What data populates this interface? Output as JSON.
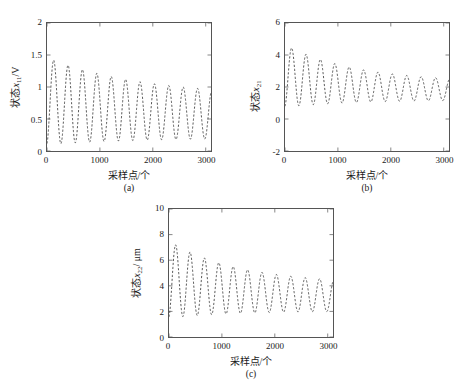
{
  "figure": {
    "background": "#ffffff",
    "line_color": "#3a3a3a",
    "axis_color": "#555555"
  },
  "panels": [
    {
      "caption": "(a)",
      "xlabel": "采样点/个",
      "ylabel_prefix": "状态",
      "ylabel_var": "x",
      "ylabel_sub": "11",
      "ylabel_suffix": "/V",
      "ylabel_full": "状态x11/V",
      "xticks": [
        "0",
        "1000",
        "2000",
        "3000"
      ],
      "yticks": [
        "0",
        "0.5",
        "1",
        "1.5",
        "2"
      ]
    },
    {
      "caption": "(b)",
      "xlabel": "采样点/个",
      "ylabel_prefix": "状态",
      "ylabel_var": "x",
      "ylabel_sub": "21",
      "ylabel_suffix": "",
      "ylabel_full": "状态x21",
      "xticks": [
        "0",
        "1000",
        "2000",
        "3000"
      ],
      "yticks": [
        "-2",
        "0",
        "2",
        "4",
        "6"
      ]
    },
    {
      "caption": "(c)",
      "xlabel": "采样点/个",
      "ylabel_prefix": "状态",
      "ylabel_var": "x",
      "ylabel_sub": "22",
      "ylabel_suffix": "/ μm",
      "ylabel_full": "状态x22/ μm",
      "xticks": [
        "0",
        "1000",
        "2000",
        "3000"
      ],
      "yticks": [
        "0",
        "2",
        "4",
        "6",
        "8",
        "10"
      ]
    }
  ],
  "chart_data": [
    {
      "type": "line",
      "panel": "(a)",
      "title": "",
      "xlabel": "采样点/个",
      "ylabel": "状态x11/V",
      "xlim": [
        0,
        3100
      ],
      "ylim": [
        0,
        2
      ],
      "xticks": [
        0,
        1000,
        2000,
        3000
      ],
      "yticks": [
        0,
        0.5,
        1,
        1.5,
        2
      ],
      "grid": false,
      "legend": "none",
      "linestyle": "dashed",
      "series": [
        {
          "name": "x11",
          "description": "Damped oscillation settling toward ~0.55 mean; initial peak ~1.45 at n~110, troughs ~0.17, period ~270 samples.",
          "model": {
            "mean_start": 0.78,
            "mean_end": 0.53,
            "amp_start": 0.68,
            "amp_end": 0.32,
            "period": 272,
            "phase": -1.35,
            "decay": 0.00055
          },
          "sample_points": [
            {
              "x": 0,
              "y": 0.95
            },
            {
              "x": 110,
              "y": 1.45
            },
            {
              "x": 240,
              "y": 0.2
            },
            {
              "x": 390,
              "y": 1.3
            },
            {
              "x": 520,
              "y": 0.2
            },
            {
              "x": 670,
              "y": 1.21
            },
            {
              "x": 800,
              "y": 0.2
            },
            {
              "x": 940,
              "y": 1.12
            },
            {
              "x": 1070,
              "y": 0.2
            },
            {
              "x": 1210,
              "y": 1.02
            },
            {
              "x": 1340,
              "y": 0.2
            },
            {
              "x": 1480,
              "y": 0.96
            },
            {
              "x": 1610,
              "y": 0.2
            },
            {
              "x": 1750,
              "y": 0.88
            },
            {
              "x": 1880,
              "y": 0.21
            },
            {
              "x": 2020,
              "y": 0.84
            },
            {
              "x": 2150,
              "y": 0.21
            },
            {
              "x": 2290,
              "y": 0.8
            },
            {
              "x": 2420,
              "y": 0.22
            },
            {
              "x": 2560,
              "y": 0.79
            },
            {
              "x": 2690,
              "y": 0.22
            },
            {
              "x": 2830,
              "y": 0.78
            },
            {
              "x": 2960,
              "y": 0.23
            },
            {
              "x": 3060,
              "y": 0.45
            }
          ]
        }
      ]
    },
    {
      "type": "line",
      "panel": "(b)",
      "title": "",
      "xlabel": "采样点/个",
      "ylabel": "状态x21",
      "xlim": [
        0,
        3100
      ],
      "ylim": [
        -2,
        6
      ],
      "xticks": [
        0,
        1000,
        2000,
        3000
      ],
      "yticks": [
        -2,
        0,
        2,
        4,
        6
      ],
      "grid": false,
      "legend": "none",
      "linestyle": "dashed",
      "series": [
        {
          "name": "x21",
          "description": "Damped oscillation around mean ~1.8; initial peak ~4.6 at n~90, troughs ~1.2, period ~272 samples.",
          "model": {
            "mean_start": 2.7,
            "mean_end": 1.75,
            "amp_start": 1.95,
            "amp_end": 0.55,
            "period": 272,
            "phase": -1.35,
            "decay": 0.00075
          },
          "sample_points": [
            {
              "x": 0,
              "y": 3.4
            },
            {
              "x": 90,
              "y": 4.6
            },
            {
              "x": 240,
              "y": 1.3
            },
            {
              "x": 380,
              "y": 4.25
            },
            {
              "x": 520,
              "y": 1.25
            },
            {
              "x": 660,
              "y": 3.95
            },
            {
              "x": 800,
              "y": 1.25
            },
            {
              "x": 930,
              "y": 3.6
            },
            {
              "x": 1070,
              "y": 1.3
            },
            {
              "x": 1200,
              "y": 3.2
            },
            {
              "x": 1340,
              "y": 1.3
            },
            {
              "x": 1480,
              "y": 3.1
            },
            {
              "x": 1610,
              "y": 1.3
            },
            {
              "x": 1750,
              "y": 2.75
            },
            {
              "x": 1880,
              "y": 1.35
            },
            {
              "x": 2020,
              "y": 2.6
            },
            {
              "x": 2150,
              "y": 1.35
            },
            {
              "x": 2290,
              "y": 2.45
            },
            {
              "x": 2420,
              "y": 1.35
            },
            {
              "x": 2560,
              "y": 2.3
            },
            {
              "x": 2690,
              "y": 1.4
            },
            {
              "x": 2830,
              "y": 2.25
            },
            {
              "x": 2960,
              "y": 1.4
            },
            {
              "x": 3060,
              "y": 1.6
            }
          ]
        }
      ]
    },
    {
      "type": "line",
      "panel": "(c)",
      "title": "",
      "xlabel": "采样点/个",
      "ylabel": "状态x22/ μm",
      "xlim": [
        0,
        3100
      ],
      "ylim": [
        0,
        10
      ],
      "xticks": [
        0,
        1000,
        2000,
        3000
      ],
      "yticks": [
        0,
        2,
        4,
        6,
        8,
        10
      ],
      "grid": false,
      "legend": "none",
      "linestyle": "dashed",
      "series": [
        {
          "name": "x22",
          "description": "Damped oscillation around mean ~3.2; initial peak ~7.5 at n~110, troughs ~2.0, period ~272 samples.",
          "model": {
            "mean_start": 4.5,
            "mean_end": 3.1,
            "amp_start": 3.0,
            "amp_end": 1.05,
            "period": 272,
            "phase": -1.35,
            "decay": 0.00075
          },
          "sample_points": [
            {
              "x": 0,
              "y": 5.0
            },
            {
              "x": 110,
              "y": 7.5
            },
            {
              "x": 250,
              "y": 2.0
            },
            {
              "x": 390,
              "y": 6.7
            },
            {
              "x": 520,
              "y": 2.0
            },
            {
              "x": 670,
              "y": 6.2
            },
            {
              "x": 800,
              "y": 2.0
            },
            {
              "x": 940,
              "y": 5.9
            },
            {
              "x": 1070,
              "y": 2.0
            },
            {
              "x": 1210,
              "y": 5.5
            },
            {
              "x": 1340,
              "y": 2.0
            },
            {
              "x": 1480,
              "y": 5.1
            },
            {
              "x": 1610,
              "y": 2.0
            },
            {
              "x": 1750,
              "y": 4.7
            },
            {
              "x": 1880,
              "y": 2.0
            },
            {
              "x": 2020,
              "y": 4.5
            },
            {
              "x": 2150,
              "y": 2.0
            },
            {
              "x": 2290,
              "y": 4.3
            },
            {
              "x": 2420,
              "y": 2.05
            },
            {
              "x": 2560,
              "y": 4.2
            },
            {
              "x": 2690,
              "y": 2.05
            },
            {
              "x": 2830,
              "y": 4.1
            },
            {
              "x": 2960,
              "y": 2.05
            },
            {
              "x": 3060,
              "y": 2.3
            }
          ]
        }
      ]
    }
  ]
}
